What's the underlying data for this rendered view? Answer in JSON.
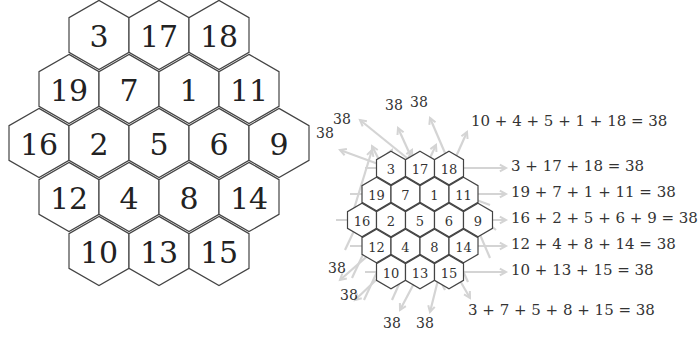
{
  "magic_constant": "38",
  "colors": {
    "hex_stroke": "#444444",
    "arrow": "#d4d4d4",
    "text": "#333333"
  },
  "grid": {
    "rows": [
      [
        "3",
        "17",
        "18"
      ],
      [
        "19",
        "7",
        "1",
        "11"
      ],
      [
        "16",
        "2",
        "5",
        "6",
        "9"
      ],
      [
        "12",
        "4",
        "8",
        "14"
      ],
      [
        "10",
        "13",
        "15"
      ]
    ]
  },
  "sum_labels": [
    "38",
    "38",
    "38",
    "38",
    "38",
    "38",
    "38",
    "38",
    "38"
  ],
  "equations": {
    "diag_up": "10 + 4 + 5 + 1 + 18 = 38",
    "row1": "3 + 17 + 18 = 38",
    "row2": "19 + 7 + 1 + 11 = 38",
    "row3": "16 + 2 + 5 + 6 + 9 = 38",
    "row4": "12 + 4 + 8 + 14 = 38",
    "row5": "10 + 13 + 15 = 38",
    "diag_down": "3 + 7 + 5 + 8 + 15 = 38"
  }
}
